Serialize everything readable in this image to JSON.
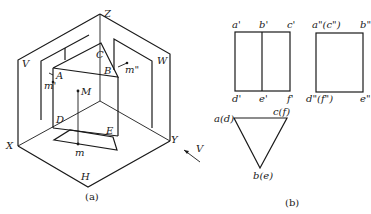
{
  "figure_a": {
    "caption": "(a)",
    "planes": {
      "V": "V",
      "W": "W",
      "H": "H"
    },
    "axes": {
      "X": "X",
      "Y": "Y",
      "Z": "Z"
    },
    "vertices": {
      "A": "A",
      "B": "B",
      "C": "C",
      "D": "D",
      "E": "E"
    },
    "points": {
      "M": "M",
      "m": "m",
      "m_prime": "m'",
      "m_double_prime": "m\""
    },
    "view_direction": "V"
  },
  "figure_b": {
    "caption": "(b)",
    "front_view": {
      "top_labels": [
        "a'",
        "b'",
        "c'"
      ],
      "bottom_labels": [
        "d'",
        "e'",
        "f'"
      ]
    },
    "side_view": {
      "top_labels": [
        "a\"(c\")",
        "b\""
      ],
      "bottom_labels": [
        "d\"(f\")",
        "e\""
      ]
    },
    "top_view": {
      "labels": [
        "a(d)",
        "c(f)",
        "b(e)"
      ]
    }
  }
}
